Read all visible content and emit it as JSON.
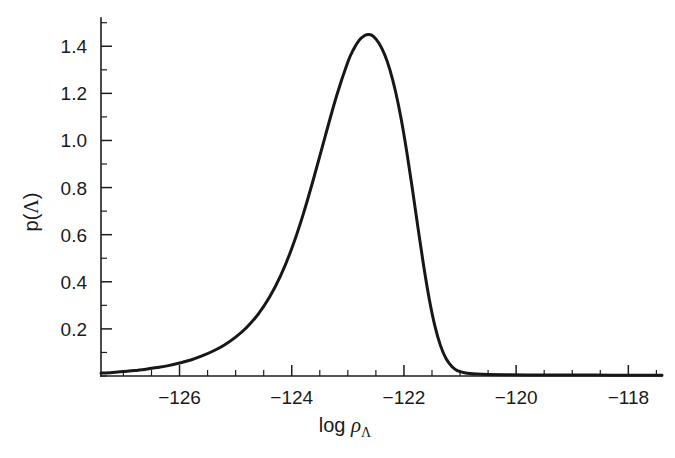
{
  "figure": {
    "background_color": "#ffffff",
    "line_color": "#171717",
    "axis_color": "#1d1d1d"
  },
  "axis_titles": {
    "x_prefix": "log",
    "x_symbol": "ρ",
    "x_subscript": "Λ",
    "y_prefix": "p(",
    "y_symbol": "Λ",
    "y_suffix": ")"
  },
  "xticks": [
    {
      "label": "−126",
      "value": -126
    },
    {
      "label": "−124",
      "value": -124
    },
    {
      "label": "−122",
      "value": -122
    },
    {
      "label": "−120",
      "value": -120
    },
    {
      "label": "−118",
      "value": -118
    }
  ],
  "yticks": [
    {
      "label": "1.4",
      "value": 1.4
    },
    {
      "label": "1.2",
      "value": 1.2
    },
    {
      "label": "1.0",
      "value": 1.0
    },
    {
      "label": "0.8",
      "value": 0.8
    },
    {
      "label": "0.6",
      "value": 0.6
    },
    {
      "label": "0.4",
      "value": 0.4
    },
    {
      "label": "0.2",
      "value": 0.2
    }
  ],
  "chart_data": {
    "type": "line",
    "title": "",
    "subtitle": "",
    "xlabel": "log ρΛ",
    "ylabel": "p(Λ)",
    "xlim": [
      -127.4,
      -117.4
    ],
    "ylim": [
      0.0,
      1.52
    ],
    "grid": false,
    "legend": null,
    "annotations": [],
    "x_major_step": 2,
    "x_minor_step": 0.5,
    "y_major_step": 0.2,
    "y_minor_step": 0.1,
    "peak": {
      "x": -122.62,
      "y": 1.45
    },
    "series": [
      {
        "name": "p(Λ)",
        "color": "#171717",
        "x": [
          -127.4,
          -127.2,
          -127.0,
          -126.8,
          -126.6,
          -126.4,
          -126.2,
          -126.0,
          -125.8,
          -125.6,
          -125.4,
          -125.2,
          -125.0,
          -124.8,
          -124.6,
          -124.4,
          -124.2,
          -124.0,
          -123.8,
          -123.6,
          -123.4,
          -123.2,
          -123.0,
          -122.9,
          -122.8,
          -122.7,
          -122.62,
          -122.55,
          -122.45,
          -122.35,
          -122.25,
          -122.15,
          -122.05,
          -121.95,
          -121.85,
          -121.75,
          -121.65,
          -121.55,
          -121.45,
          -121.35,
          -121.25,
          -121.15,
          -121.05,
          -120.9,
          -120.7,
          -120.5,
          -120.2,
          -119.8,
          -119.2,
          -118.6,
          -118.0,
          -117.4
        ],
        "y": [
          0.012,
          0.015,
          0.019,
          0.023,
          0.029,
          0.036,
          0.044,
          0.055,
          0.068,
          0.085,
          0.106,
          0.132,
          0.165,
          0.207,
          0.262,
          0.333,
          0.425,
          0.541,
          0.683,
          0.847,
          1.021,
          1.19,
          1.333,
          1.386,
          1.425,
          1.446,
          1.45,
          1.443,
          1.415,
          1.368,
          1.3,
          1.208,
          1.092,
          0.952,
          0.795,
          0.63,
          0.47,
          0.328,
          0.214,
          0.13,
          0.074,
          0.041,
          0.023,
          0.013,
          0.008,
          0.006,
          0.005,
          0.004,
          0.004,
          0.004,
          0.003,
          0.003
        ]
      }
    ]
  }
}
